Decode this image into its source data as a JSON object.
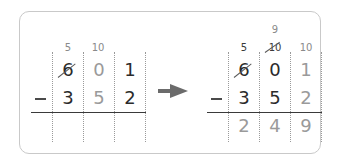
{
  "left_problem": {
    "borrow_marks": [
      "5",
      "10"
    ],
    "minuend": [
      "6",
      "0",
      "1"
    ],
    "subtrahend": [
      "3",
      "5",
      "2"
    ],
    "operator": "−",
    "crossed_out": [
      "6"
    ]
  },
  "right_problem": {
    "borrow_marks_top": [
      "9"
    ],
    "borrow_marks": [
      "5",
      "10",
      "10"
    ],
    "minuend": [
      "6",
      "0",
      "1"
    ],
    "subtrahend": [
      "3",
      "5",
      "2"
    ],
    "result": [
      "2",
      "4",
      "9"
    ],
    "operator": "−",
    "crossed_out": [
      "6",
      "10"
    ]
  },
  "arrow": {
    "icon": "right-arrow-icon",
    "color": "#6b6b6b"
  }
}
